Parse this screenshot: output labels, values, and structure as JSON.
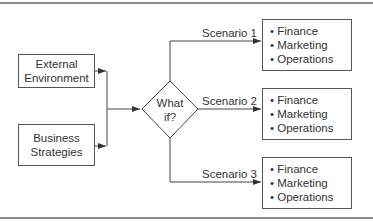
{
  "diagram": {
    "inputs": [
      {
        "lines": [
          "External",
          "Environment"
        ]
      },
      {
        "lines": [
          "Business",
          "Strategies"
        ]
      }
    ],
    "decision": {
      "lines": [
        "What",
        "if?"
      ]
    },
    "scenarios": [
      {
        "label": "Scenario 1",
        "items": [
          "• Finance",
          "• Marketing",
          "• Operations"
        ]
      },
      {
        "label": "Scenario 2",
        "items": [
          "• Finance",
          "• Marketing",
          "• Operations"
        ]
      },
      {
        "label": "Scenario 3",
        "items": [
          "• Finance",
          "• Marketing",
          "• Operations"
        ]
      }
    ],
    "colors": {
      "line": "#444444",
      "border": "#555555",
      "rule": "#8a8a8a"
    }
  }
}
